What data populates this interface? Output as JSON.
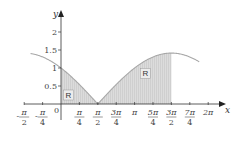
{
  "chart_data": {
    "type": "area",
    "title": "",
    "xlabel": "x",
    "ylabel": "y",
    "function": "y = |cos(x/2) - sin(x/2)|",
    "xlim": [
      -1.5708,
      6.2832
    ],
    "ylim": [
      0,
      2.2
    ],
    "grid": false,
    "x_ticks": [
      {
        "value": -1.5708,
        "num": "π",
        "den": "2",
        "sign": "-"
      },
      {
        "value": -0.7854,
        "num": "π",
        "den": "4",
        "sign": "-"
      },
      {
        "value": 0.7854,
        "num": "π",
        "den": "4",
        "sign": ""
      },
      {
        "value": 1.5708,
        "num": "π",
        "den": "2",
        "sign": ""
      },
      {
        "value": 2.3562,
        "num": "3π",
        "den": "4",
        "sign": ""
      },
      {
        "value": 3.1416,
        "num": "π",
        "den": "",
        "sign": ""
      },
      {
        "value": 3.927,
        "num": "5π",
        "den": "4",
        "sign": ""
      },
      {
        "value": 4.7124,
        "num": "3π",
        "den": "2",
        "sign": ""
      },
      {
        "value": 5.4978,
        "num": "7π",
        "den": "4",
        "sign": ""
      },
      {
        "value": 6.2832,
        "num": "2π",
        "den": "",
        "sign": ""
      }
    ],
    "y_ticks": [
      {
        "value": 0.5,
        "label": "0.5"
      },
      {
        "value": 1,
        "label": "1"
      },
      {
        "value": 1.5,
        "label": "1.5"
      },
      {
        "value": 2,
        "label": "2"
      }
    ],
    "origin_label": "0",
    "curve_domain": [
      -1.3,
      5.9
    ],
    "shaded_region": {
      "from": 0,
      "to": 4.7124,
      "label": "R"
    },
    "region_labels": [
      {
        "text": "R",
        "x": 0.32,
        "y": 0.25
      },
      {
        "text": "R",
        "x": 3.6,
        "y": 0.85
      }
    ],
    "colors": {
      "curve": "#a8a8a8",
      "fill": "#d6d6d6",
      "axis": "#333333"
    }
  }
}
